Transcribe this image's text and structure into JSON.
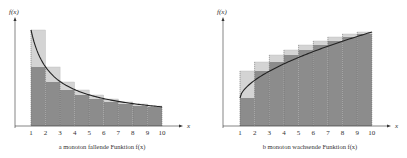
{
  "chart_data": [
    {
      "type": "bar",
      "title": "a  monoton fallende Funktion f(x)",
      "panel_letter": "a",
      "caption": "monoton fallende Funktion f(x)",
      "xlabel": "x",
      "ylabel": "f(x)",
      "categories": [
        "1",
        "2",
        "3",
        "4",
        "5",
        "6",
        "7",
        "8",
        "9",
        "10"
      ],
      "curve": "decreasing",
      "series": [
        {
          "name": "f(x) at integer x (upper sums)",
          "x": [
            1,
            2,
            3,
            4,
            5,
            6,
            7,
            8,
            9
          ],
          "values": [
            96,
            59,
            44,
            36,
            31,
            27,
            24,
            22,
            20
          ]
        },
        {
          "name": "f(x+1) (lower sums)",
          "x": [
            1,
            2,
            3,
            4,
            5,
            6,
            7,
            8,
            9
          ],
          "values": [
            59,
            44,
            36,
            31,
            27,
            24,
            22,
            20,
            19
          ]
        }
      ],
      "xlim": [
        0,
        10.8
      ],
      "ylim": [
        0,
        100
      ],
      "grid": false,
      "legend": "none"
    },
    {
      "type": "bar",
      "title": "b  monoton wachsende Funktion f(x)",
      "panel_letter": "b",
      "caption": "monoton wachsende Funktion f(x)",
      "xlabel": "x",
      "ylabel": "f(x)",
      "categories": [
        "1",
        "2",
        "3",
        "4",
        "5",
        "6",
        "7",
        "8",
        "9",
        "10"
      ],
      "curve": "increasing",
      "series": [
        {
          "name": "f(x) at integer x (lower sums)",
          "x": [
            1,
            2,
            3,
            4,
            5,
            6,
            7,
            8,
            9
          ],
          "values": [
            28,
            55,
            64,
            71,
            76,
            81,
            85,
            89,
            92
          ]
        },
        {
          "name": "f(x+1) (upper sums)",
          "x": [
            1,
            2,
            3,
            4,
            5,
            6,
            7,
            8,
            9
          ],
          "values": [
            55,
            64,
            71,
            76,
            81,
            85,
            89,
            92,
            94
          ]
        }
      ],
      "xlim": [
        0,
        10.8
      ],
      "ylim": [
        0,
        100
      ],
      "grid": false,
      "legend": "none"
    }
  ],
  "panels": [
    {
      "letter": "a",
      "caption": "monoton fallende Funktion f(x)",
      "ylabel": "f(x)",
      "xlabel": "x"
    },
    {
      "letter": "b",
      "caption": "monoton wachsende Funktion f(x)",
      "ylabel": "f(x)",
      "xlabel": "x"
    }
  ],
  "colors": {
    "dark_fill": "#8c8c8c",
    "light_fill": "#d4d4d4",
    "curve": "#222222",
    "axis": "#333333"
  }
}
